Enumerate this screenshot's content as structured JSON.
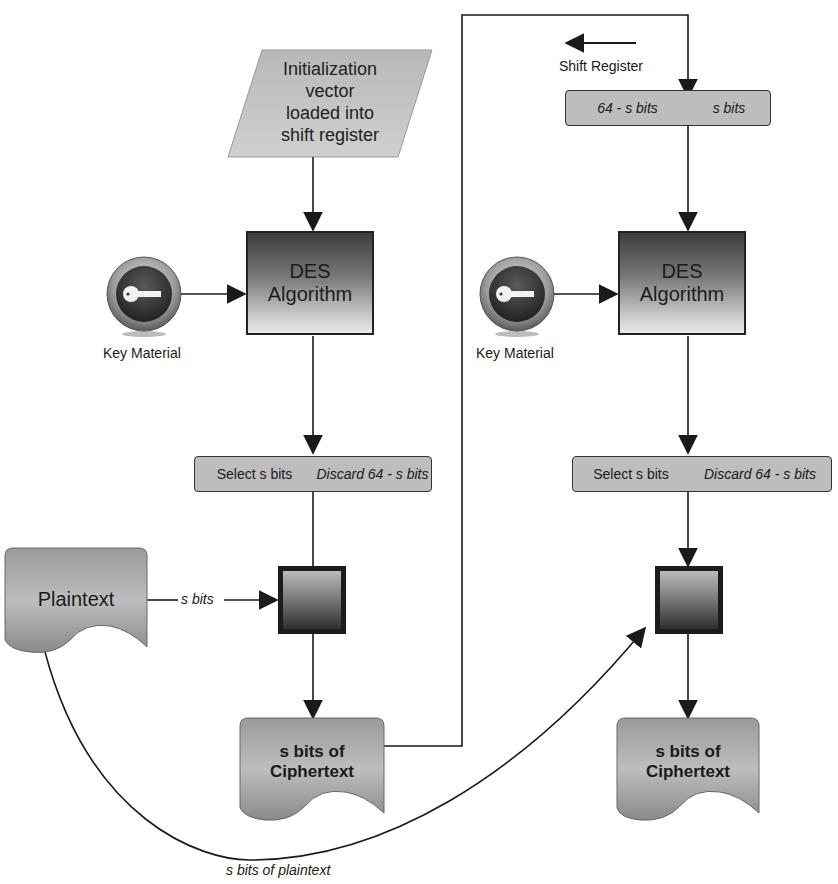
{
  "diagram": {
    "iv_box": {
      "label": "Initialization vector loaded into shift register",
      "lines": [
        "Initialization",
        "vector",
        "loaded into",
        "shift register"
      ]
    },
    "shift_register": {
      "label": "Shift Register",
      "left_cell": "64 - s bits",
      "right_cell": "s bits"
    },
    "stages": [
      {
        "des_box": {
          "line1": "DES",
          "line2": "Algorithm"
        },
        "key": {
          "label": "Key Material",
          "icon": "key-icon"
        },
        "select_bar": {
          "select": "Select s bits",
          "discard": "Discard 64 - s bits"
        },
        "xor": {
          "icon": "xor-square"
        },
        "output": {
          "line1": "s bits of",
          "line2": "Ciphertext"
        }
      },
      {
        "des_box": {
          "line1": "DES",
          "line2": "Algorithm"
        },
        "key": {
          "label": "Key Material",
          "icon": "key-icon"
        },
        "select_bar": {
          "select": "Select s bits",
          "discard": "Discard 64 - s bits"
        },
        "xor": {
          "icon": "xor-square"
        },
        "output": {
          "line1": "s bits of",
          "line2": "Ciphertext"
        }
      }
    ],
    "plaintext": {
      "label": "Plaintext"
    },
    "edge_labels": {
      "plaintext_to_xor": "s bits",
      "plaintext_curve": "s bits of plaintext"
    },
    "colors": {
      "box_fill": "#bdbdbd",
      "line": "#1a1a1a",
      "des_dark": "#3d3d3d",
      "des_light": "#e8e8e8"
    }
  }
}
